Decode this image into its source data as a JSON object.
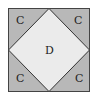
{
  "diagram": {
    "type": "square-with-inscribed-diamond",
    "colors": {
      "outer_fill": "#b8b8b8",
      "inner_fill": "#ebebeb",
      "stroke": "#333333",
      "background": "#ffffff"
    },
    "labels": {
      "top_left": "C",
      "top_right": "C",
      "bottom_left": "C",
      "bottom_right": "C",
      "center": "D"
    }
  }
}
